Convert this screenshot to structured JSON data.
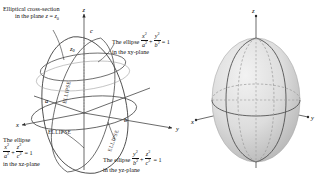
{
  "figure": {
    "left_panel": {
      "name": "wireframe-ellipsoid",
      "captions": {
        "cross_section_line1": "Elliptical cross-section",
        "cross_section_line2_pre": "in the plane ",
        "cross_section_line2_var": "z",
        "cross_section_line2_eq": " = ",
        "cross_section_line2_val": "z",
        "cross_section_line2_sub": "0",
        "xy_pre": "The ellipse ",
        "xy_num1": "x",
        "xy_num1_exp": "2",
        "xy_den1": "a",
        "xy_den1_exp": "2",
        "xy_plus": "+",
        "xy_num2": "y",
        "xy_num2_exp": "2",
        "xy_den2": "b",
        "xy_den2_exp": "2",
        "xy_eq": "= 1",
        "xy_tail": "in the xy-plane",
        "xz_pre": "The ellipse",
        "xz_num1": "x",
        "xz_num1_exp": "2",
        "xz_den1": "a",
        "xz_den1_exp": "2",
        "xz_plus": "+",
        "xz_num2": "z",
        "xz_num2_exp": "2",
        "xz_den2": "c",
        "xz_den2_exp": "2",
        "xz_eq": "= 1",
        "xz_tail": "in the xz-plane",
        "yz_pre": "The ellipse ",
        "yz_num1": "y",
        "yz_num1_exp": "2",
        "yz_den1": "b",
        "yz_den1_exp": "2",
        "yz_plus": "+",
        "yz_num2": "z",
        "yz_num2_exp": "2",
        "yz_den2": "c",
        "yz_den2_exp": "2",
        "yz_eq": "= 1",
        "yz_tail": "in the yz-plane"
      },
      "axis_labels": {
        "x": "x",
        "y": "y",
        "z": "z"
      },
      "semi_axes": {
        "a": "a",
        "b": "b",
        "c": "c"
      },
      "plane_marker": {
        "z0": "z",
        "z0_sub": "0"
      },
      "ellipse_words": [
        "ELLIPSE",
        "ELLIPSE",
        "ELLIPSE"
      ]
    },
    "right_panel": {
      "name": "shaded-ellipsoid",
      "axis_labels": {
        "x": "x",
        "y": "y",
        "z": "z"
      }
    },
    "colors": {
      "ink": "#1a1a1a",
      "curve": "#3d3d3d",
      "dashed": "#8c8c8c",
      "surface_light": "#e8e8e8",
      "surface_mid": "#d2d2d2",
      "surface_dark": "#b9b9b9",
      "axis": "#2b2b2b"
    }
  }
}
